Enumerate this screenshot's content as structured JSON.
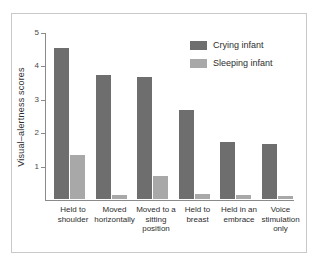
{
  "chart_data": {
    "type": "bar",
    "title": "",
    "xlabel": "",
    "ylabel": "Visual–alertness scores",
    "ylim": [
      0,
      5
    ],
    "yticks": [
      "1",
      "2",
      "3",
      "4",
      "5"
    ],
    "grid": false,
    "legend_position": "top-right",
    "categories": [
      "Held to shoulder",
      "Moved horizontally",
      "Moved to a sitting position",
      "Held to breast",
      "Held in an embrace",
      "Voice stimulation only"
    ],
    "category_lines": [
      [
        "Held to",
        "shoulder"
      ],
      [
        "Moved",
        "horizontally"
      ],
      [
        "Moved to a",
        "sitting",
        "position"
      ],
      [
        "Held to",
        "breast"
      ],
      [
        "Held in an",
        "embrace"
      ],
      [
        "Voice",
        "stimulation",
        "only"
      ]
    ],
    "series": [
      {
        "name": "Crying infant",
        "color": "#6e6e6e",
        "values": [
          4.52,
          3.72,
          3.64,
          2.68,
          1.7,
          1.65
        ]
      },
      {
        "name": "Sleeping infant",
        "color": "#a8a8a8",
        "values": [
          1.32,
          0.11,
          0.7,
          0.15,
          0.12,
          0.08
        ]
      }
    ]
  },
  "legend": {
    "items": [
      {
        "label": "Crying infant",
        "color": "#6e6e6e"
      },
      {
        "label": "Sleeping infant",
        "color": "#a8a8a8"
      }
    ]
  },
  "axes": {
    "y_label": "Visual–alertness scores",
    "y_ticks": [
      "5",
      "4",
      "3",
      "2",
      "1"
    ]
  }
}
